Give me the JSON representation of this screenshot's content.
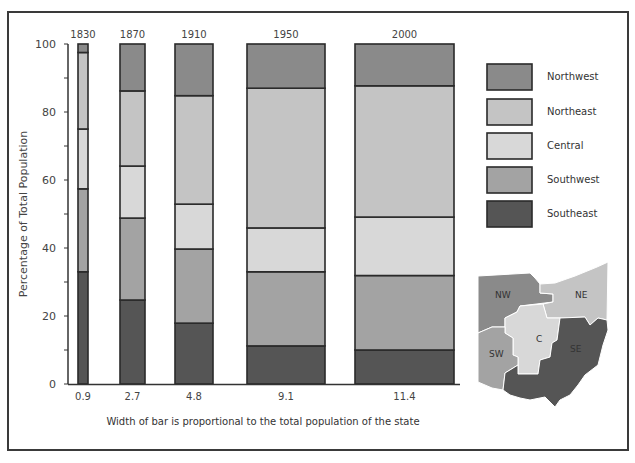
{
  "chart_data": {
    "type": "bar",
    "subtype": "stacked-100-variable-width",
    "title": "",
    "xlabel": "",
    "ylabel": "Percentage of Total Population",
    "caption": "Width of bar is proportional to the total population of the state",
    "ylim": [
      0,
      100
    ],
    "yticks": [
      0,
      20,
      40,
      60,
      80,
      100
    ],
    "categories": [
      "1830",
      "1870",
      "1910",
      "1950",
      "2000"
    ],
    "bar_width_values": [
      "0.9",
      "2.7",
      "4.8",
      "9.1",
      "11.4"
    ],
    "series": [
      {
        "name": "Southeast",
        "color": "#555555",
        "values": [
          33,
          24.7,
          17.9,
          11.2,
          10
        ]
      },
      {
        "name": "Southwest",
        "color": "#a3a3a3",
        "values": [
          24.4,
          24.1,
          21.8,
          21.8,
          21.9
        ]
      },
      {
        "name": "Central",
        "color": "#d8d8d8",
        "values": [
          17.6,
          15.3,
          13.2,
          12.9,
          17.2
        ]
      },
      {
        "name": "Northeast",
        "color": "#c4c4c4",
        "values": [
          22.5,
          22.1,
          31.9,
          41.1,
          38.6
        ]
      },
      {
        "name": "Northwest",
        "color": "#8a8a8a",
        "values": [
          2.5,
          13.8,
          15.2,
          13.0,
          12.3
        ]
      }
    ],
    "legend": {
      "position": "right",
      "entries": [
        "Northwest",
        "Northeast",
        "Central",
        "Southwest",
        "Southeast"
      ]
    },
    "grid": false
  },
  "map": {
    "labels": {
      "nw": "NW",
      "ne": "NE",
      "c": "C",
      "sw": "SW",
      "se": "SE"
    }
  }
}
